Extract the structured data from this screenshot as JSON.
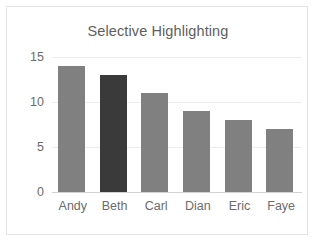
{
  "chart_data": {
    "type": "bar",
    "title": "Selective Highlighting",
    "xlabel": "",
    "ylabel": "",
    "categories": [
      "Andy",
      "Beth",
      "Carl",
      "Dian",
      "Eric",
      "Faye"
    ],
    "values": [
      14,
      13,
      11,
      9,
      8,
      7
    ],
    "ylim": [
      0,
      15
    ],
    "yticks": [
      0,
      5,
      10,
      15
    ],
    "ytick_labels": [
      "0",
      "5",
      "10",
      "15"
    ],
    "grid": true,
    "legend": false,
    "bar_colors": [
      "#808080",
      "#3a3a3a",
      "#808080",
      "#808080",
      "#808080",
      "#808080"
    ],
    "highlight_category": "Beth",
    "colors": {
      "bar_default": "#808080",
      "bar_highlight": "#3a3a3a",
      "gridline": "#ededed",
      "axis": "#d2d2d2",
      "text": "#6b6b6b",
      "title": "#5e5e5e",
      "background": "#ffffff",
      "border": "#e4e4e4"
    }
  }
}
